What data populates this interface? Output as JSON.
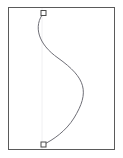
{
  "document": {
    "title": "Bezier Curve Canvas",
    "background_color": "#ffffff"
  },
  "canvas": {
    "name": "drawing-canvas",
    "left": 8,
    "top": 7,
    "width": 107,
    "height": 143,
    "fill_color": "#ffffff",
    "border_color": "#5a5a5a",
    "border_width": 1
  },
  "guide": {
    "name": "vertical-guide-line",
    "x": 42,
    "y_start": 8,
    "y_end": 149,
    "color": "#f0f0f2",
    "width": 1
  },
  "curve": {
    "name": "bezier-curve",
    "type": "cubic-bezier",
    "stroke_color": "#6e6e76",
    "stroke_width": 1,
    "fill": "none",
    "path": "M 43.5 13 C 33 26 38 44 58 58 C 86 78 90 92 74 118 C 66 131 53 140 43.5 144.5",
    "start_point": {
      "x": 43.5,
      "y": 13
    },
    "end_point": {
      "x": 43.5,
      "y": 144.5
    },
    "control_points": [
      {
        "x": 33,
        "y": 26
      },
      {
        "x": 38,
        "y": 44
      },
      {
        "x": 58,
        "y": 58
      },
      {
        "x": 86,
        "y": 78
      },
      {
        "x": 90,
        "y": 92
      },
      {
        "x": 74,
        "y": 118
      },
      {
        "x": 66,
        "y": 131
      },
      {
        "x": 53,
        "y": 140
      }
    ],
    "rightmost_x": 87,
    "leftmost_x": 37
  },
  "anchors": [
    {
      "name": "anchor-point-start",
      "label": "start-anchor",
      "x": 43.5,
      "y": 13,
      "size": 5,
      "fill_color": "#ffffff",
      "stroke_color": "#4a4a4a"
    },
    {
      "name": "anchor-point-end",
      "label": "end-anchor",
      "x": 43.5,
      "y": 144.5,
      "size": 5,
      "fill_color": "#ffffff",
      "stroke_color": "#4a4a4a"
    }
  ]
}
